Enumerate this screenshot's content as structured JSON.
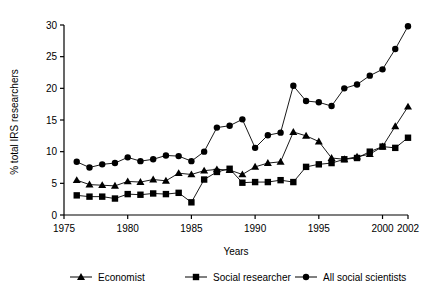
{
  "chart_data": {
    "type": "line",
    "title": "",
    "xlabel": "Years",
    "ylabel": "% total IRS researchers",
    "xlim": [
      1975,
      2002
    ],
    "ylim": [
      0,
      30
    ],
    "xticks": [
      1975,
      1980,
      1985,
      1990,
      1995,
      2000,
      2002
    ],
    "yticks": [
      0,
      5,
      10,
      15,
      20,
      25,
      30
    ],
    "grid": false,
    "legend_position": "bottom",
    "series": [
      {
        "name": "Economist",
        "marker": "triangle",
        "x": [
          1976,
          1977,
          1978,
          1979,
          1980,
          1981,
          1982,
          1983,
          1984,
          1985,
          1986,
          1987,
          1988,
          1989,
          1990,
          1991,
          1992,
          1993,
          1994,
          1995,
          1996,
          1997,
          1998,
          1999,
          2000,
          2001,
          2002
        ],
        "y": [
          5.5,
          4.8,
          4.7,
          4.6,
          5.3,
          5.2,
          5.6,
          5.4,
          6.6,
          6.4,
          7.0,
          7.2,
          7.1,
          6.4,
          7.6,
          8.2,
          8.4,
          13.1,
          12.5,
          11.6,
          9.0,
          8.8,
          9.2,
          9.6,
          10.8,
          14.0,
          17.1
        ]
      },
      {
        "name": "Social researcher",
        "marker": "square",
        "x": [
          1976,
          1977,
          1978,
          1979,
          1980,
          1981,
          1982,
          1983,
          1984,
          1985,
          1986,
          1987,
          1988,
          1989,
          1990,
          1991,
          1992,
          1993,
          1994,
          1995,
          1996,
          1997,
          1998,
          1999,
          2000,
          2001,
          2002
        ],
        "y": [
          3.1,
          2.9,
          2.9,
          2.6,
          3.3,
          3.2,
          3.4,
          3.3,
          3.5,
          2.0,
          5.6,
          6.8,
          7.3,
          5.1,
          5.2,
          5.2,
          5.5,
          5.2,
          7.6,
          8.0,
          8.2,
          8.8,
          9.0,
          10.0,
          10.8,
          10.6,
          12.2
        ]
      },
      {
        "name": "All social scientists",
        "marker": "circle",
        "x": [
          1976,
          1977,
          1978,
          1979,
          1980,
          1981,
          1982,
          1983,
          1984,
          1985,
          1986,
          1987,
          1988,
          1989,
          1990,
          1991,
          1992,
          1993,
          1994,
          1995,
          1996,
          1997,
          1998,
          1999,
          2000,
          2001,
          2002
        ],
        "y": [
          8.4,
          7.5,
          8.0,
          8.2,
          9.1,
          8.5,
          8.8,
          9.4,
          9.3,
          8.5,
          10.0,
          13.8,
          14.1,
          15.1,
          10.6,
          12.6,
          13.0,
          20.4,
          18.0,
          17.8,
          17.2,
          20.0,
          20.6,
          22.0,
          23.0,
          26.2,
          29.8
        ]
      }
    ],
    "legend": [
      {
        "label": "Economist",
        "marker": "triangle"
      },
      {
        "label": "Social researcher",
        "marker": "square"
      },
      {
        "label": "All social scientists",
        "marker": "circle"
      }
    ],
    "colors": {
      "line": "#000000",
      "marker": "#000000",
      "axis": "#000000",
      "background": "#ffffff"
    }
  }
}
